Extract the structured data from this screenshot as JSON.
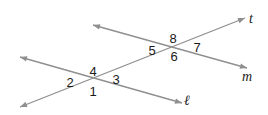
{
  "diagram": {
    "type": "transversal-angles",
    "colors": {
      "line": "#8f8f8f",
      "text": "#1a1a1a",
      "background": "#ffffff"
    },
    "lines": [
      {
        "id": "t",
        "label": "t",
        "x1": 20,
        "y1": 107,
        "x2": 245,
        "y2": 18,
        "label_x": 251,
        "label_y": 23
      },
      {
        "id": "m",
        "label": "m",
        "x1": 93,
        "y1": 25,
        "x2": 247,
        "y2": 68,
        "label_x": 247,
        "label_y": 81
      },
      {
        "id": "l",
        "label": "ℓ",
        "x1": 20,
        "y1": 57,
        "x2": 182,
        "y2": 103,
        "label_x": 187,
        "label_y": 105
      }
    ],
    "angles": [
      {
        "label": "1",
        "x": 93,
        "y": 96
      },
      {
        "label": "2",
        "x": 70,
        "y": 87
      },
      {
        "label": "3",
        "x": 116,
        "y": 84
      },
      {
        "label": "4",
        "x": 93,
        "y": 76
      },
      {
        "label": "5",
        "x": 152,
        "y": 55
      },
      {
        "label": "6",
        "x": 174,
        "y": 61
      },
      {
        "label": "7",
        "x": 197,
        "y": 52
      },
      {
        "label": "8",
        "x": 173,
        "y": 43
      }
    ]
  }
}
